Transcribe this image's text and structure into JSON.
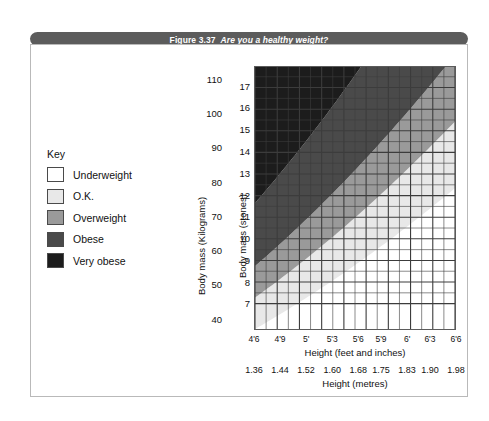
{
  "figure": {
    "number": "Figure 3.37",
    "question": "Are you a healthy weight?"
  },
  "key": {
    "title": "Key",
    "items": [
      {
        "label": "Underweight",
        "color": "#ffffff"
      },
      {
        "label": "O.K.",
        "color": "#e8e8e8"
      },
      {
        "label": "Overweight",
        "color": "#9a9a9a"
      },
      {
        "label": "Obese",
        "color": "#4a4a4a"
      },
      {
        "label": "Very obese",
        "color": "#1c1c1c"
      }
    ]
  },
  "chart_data": {
    "type": "heatmap",
    "title": "Are you a healthy weight?",
    "xlabel": "Height (feet and inches)",
    "xlabel_secondary": "Height (metres)",
    "ylabel": "Body mass (Kilograms)",
    "ylabel_secondary": "Body mass (stones)",
    "grid": true,
    "legend_position": "left-outside",
    "x_ticks_feet": [
      "4'6",
      "4'9",
      "5'",
      "5'3",
      "5'6",
      "5'9",
      "6'",
      "6'3",
      "6'6"
    ],
    "x_ticks_metres": [
      "1.36",
      "1.44",
      "1.52",
      "1.60",
      "1.68",
      "1.75",
      "1.83",
      "1.90",
      "1.98"
    ],
    "xlim_metres": [
      1.36,
      1.98
    ],
    "y_ticks_kg": [
      "110",
      "100",
      "90",
      "80",
      "70",
      "60",
      "50",
      "40"
    ],
    "ylim_kg": [
      37,
      114
    ],
    "y_ticks_stones": [
      "17",
      "16",
      "15",
      "14",
      "13",
      "12",
      "11",
      "10",
      "9",
      "8",
      "7"
    ],
    "ylim_stones": [
      7,
      17.5
    ],
    "bands": [
      {
        "name": "Underweight",
        "color": "#ffffff",
        "bmi_max": 20
      },
      {
        "name": "O.K.",
        "color": "#e8e8e8",
        "bmi_range": [
          20,
          25
        ]
      },
      {
        "name": "Overweight",
        "color": "#9a9a9a",
        "bmi_range": [
          25,
          30
        ]
      },
      {
        "name": "Obese",
        "color": "#4a4a4a",
        "bmi_range": [
          30,
          40
        ]
      },
      {
        "name": "Very obese",
        "color": "#1c1c1c",
        "bmi_min": 40
      }
    ],
    "grid_cols": 18,
    "grid_rows": 21
  },
  "colors": {
    "banner_bg": "#5c5c5c",
    "banner_text": "#ffffff",
    "card_border": "#b9b9b9",
    "plot_border": "#5b5b5b",
    "grid_line": "#3c3c3c",
    "text": "#111111"
  }
}
